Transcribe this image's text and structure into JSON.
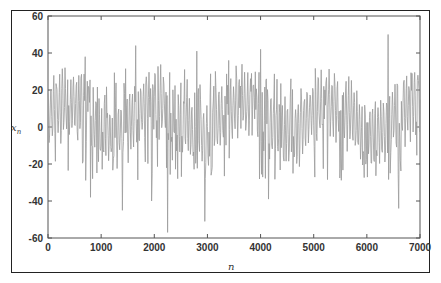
{
  "chart_data": {
    "type": "line",
    "title": "",
    "xlabel": "n",
    "ylabel": "x_n",
    "xlim": [
      0,
      7000
    ],
    "ylim": [
      -60,
      60
    ],
    "x_ticks": [
      "0",
      "1000",
      "2000",
      "3000",
      "4000",
      "5000",
      "6000",
      "7000"
    ],
    "y_ticks": [
      "60",
      "40",
      "20",
      "0",
      "-20",
      "-40",
      "-60"
    ],
    "grid": false,
    "legend": null,
    "line_color": "#9a9a9a",
    "series": [
      {
        "name": "x_n",
        "description": "chaotic oscillating time series, mostly between -20 and 30, with spikes",
        "peaks": [
          {
            "n": 700,
            "x": 38
          },
          {
            "n": 1650,
            "x": 44
          },
          {
            "n": 2800,
            "x": 41
          },
          {
            "n": 3400,
            "x": 36
          },
          {
            "n": 4000,
            "x": 42
          },
          {
            "n": 6400,
            "x": 50
          }
        ],
        "troughs": [
          {
            "n": 800,
            "x": -38
          },
          {
            "n": 1400,
            "x": -45
          },
          {
            "n": 1950,
            "x": -40
          },
          {
            "n": 2250,
            "x": -57
          },
          {
            "n": 2950,
            "x": -51
          },
          {
            "n": 4150,
            "x": -39
          },
          {
            "n": 6600,
            "x": -44
          }
        ]
      }
    ]
  },
  "axes": {
    "x_label": "n",
    "y_label": "x",
    "y_label_sub": "n"
  }
}
